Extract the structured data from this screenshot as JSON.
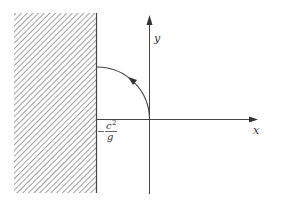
{
  "diagram": {
    "axes": {
      "x_label": "x",
      "y_label": "y"
    },
    "wall": {
      "label_sign": "−",
      "label_numerator": "c",
      "label_numerator_exp": "2",
      "label_denominator": "g"
    },
    "colors": {
      "line": "#444444",
      "hatch": "#888888",
      "background": "#ffffff"
    }
  }
}
